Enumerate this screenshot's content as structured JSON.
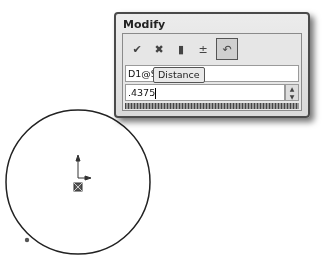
{
  "dialog": {
    "title": "Modify",
    "toolbar": [
      {
        "name": "ok-button",
        "icon": "check-icon",
        "glyph": "✔"
      },
      {
        "name": "cancel-button",
        "icon": "close-icon",
        "glyph": "✖"
      },
      {
        "name": "rebuild-button",
        "icon": "traffic-light-icon",
        "glyph": "▮"
      },
      {
        "name": "reset-spin-increment-button",
        "icon": "spin-increment-icon",
        "glyph": "±"
      },
      {
        "name": "mark-dimension-button",
        "icon": "mark-for-drawing-icon",
        "glyph": "↶"
      }
    ],
    "dimension_name": "D1@Sk",
    "tooltip": "Distance",
    "value": ".4375",
    "spin_up": "▲",
    "spin_down": "▼"
  },
  "sketch": {
    "circle": {
      "cx": 78,
      "cy": 182,
      "r": 72
    },
    "origin": {
      "x": 78,
      "y": 186
    },
    "point": {
      "x": 27,
      "y": 240
    }
  }
}
